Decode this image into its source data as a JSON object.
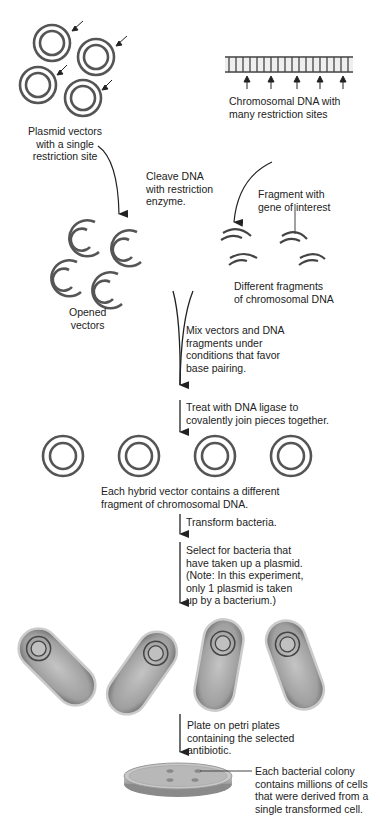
{
  "labels": {
    "plasmid_vectors": "Plasmid vectors\nwith a single\nrestriction site",
    "chromosomal_dna": "Chromosomal DNA with\nmany restriction sites",
    "cleave": "Cleave DNA\nwith restriction\nenzyme.",
    "fragment_gene": "Fragment with\ngene of interest",
    "opened_vectors": "Opened\nvectors",
    "different_fragments": "Different fragments\nof chromosomal DNA",
    "mix": "Mix vectors and DNA\nfragments under\nconditions that favor\nbase pairing.",
    "ligase": "Treat with DNA ligase to\ncovalently join pieces together.",
    "hybrid": "Each hybrid vector contains a different\nfragment of chromosomal DNA.",
    "transform": "Transform bacteria.",
    "select": "Select for bacteria that\nhave taken up a plasmid.\n(Note: In this experiment,\nonly 1 plasmid is taken\nup by a bacterium.)",
    "plate": "Plate on petri plates\ncontaining the selected\nantibiotic.",
    "colony": "Each bacterial colony\ncontains millions of cells\nthat were derived from a\nsingle transformed cell."
  },
  "colors": {
    "ring": "#555555",
    "arrow": "#222222",
    "bacterium_fill": "#a8a8a8",
    "bacterium_edge": "#d0d0d0"
  }
}
